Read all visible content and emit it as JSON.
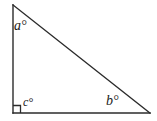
{
  "figure": {
    "name": "right-triangle-angle-diagram",
    "background_color": "#ffffff",
    "stroke_color": "#2b2b2b",
    "width": 157,
    "height": 121
  },
  "geometry": {
    "vertices": {
      "apex": {
        "x": 13,
        "y": 5
      },
      "right_angle": {
        "x": 13,
        "y": 113
      },
      "base_right": {
        "x": 150,
        "y": 113
      }
    },
    "right_angle_marker": {
      "x": 13,
      "y": 105,
      "size": 8
    }
  },
  "labels": {
    "apex_angle": "a°",
    "base_right_angle": "b°",
    "right_angle": "c°"
  }
}
